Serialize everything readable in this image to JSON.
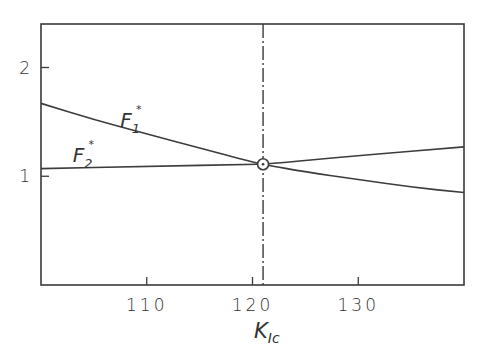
{
  "chart_data": {
    "type": "line",
    "title": "",
    "xlabel": "K",
    "xlabel_subscript": "Ic",
    "ylabel": "",
    "xlim": [
      100,
      140
    ],
    "ylim": [
      0,
      2.4
    ],
    "grid": false,
    "legend": "none",
    "x_ticks": [
      110,
      120,
      130
    ],
    "x_tick_labels": [
      "110",
      "120",
      "130"
    ],
    "y_ticks": [
      1,
      2
    ],
    "y_tick_labels": [
      "1",
      "2"
    ],
    "series": [
      {
        "name": "F1*",
        "label_main": "F",
        "label_sub": "1",
        "label_sup": "*",
        "x": [
          100,
          105,
          110,
          115,
          120,
          121,
          125,
          130,
          135,
          140
        ],
        "y": [
          1.67,
          1.52,
          1.39,
          1.26,
          1.13,
          1.11,
          1.04,
          0.97,
          0.9,
          0.85
        ]
      },
      {
        "name": "F2*",
        "label_main": "F",
        "label_sub": "2",
        "label_sup": "*",
        "x": [
          100,
          110,
          120,
          121,
          130,
          140
        ],
        "y": [
          1.07,
          1.09,
          1.11,
          1.11,
          1.19,
          1.27
        ]
      }
    ],
    "annotations": [
      {
        "type": "vertical-dash-dot-line",
        "x": 121
      },
      {
        "type": "intersection-marker",
        "x": 121,
        "y": 1.11
      }
    ]
  }
}
